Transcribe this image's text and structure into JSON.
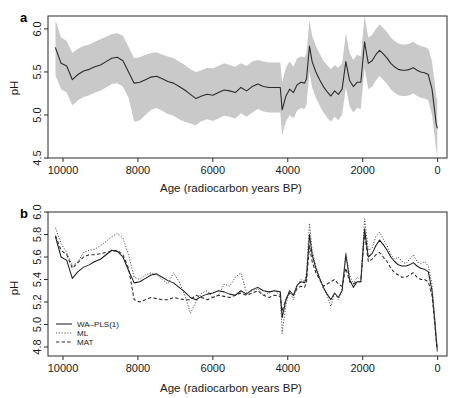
{
  "figure": {
    "panel_a_letter": "a",
    "panel_b_letter": "b",
    "xlabel": "Age (radiocarbon years BP)",
    "ylabel": "pH"
  },
  "chart_data": [
    {
      "type": "line",
      "panel": "a",
      "title": "",
      "xlabel": "Age (radiocarbon years BP)",
      "ylabel": "pH",
      "xlim": [
        10400,
        -250
      ],
      "ylim": [
        4.5,
        6.15
      ],
      "xticks": [
        10000,
        8000,
        6000,
        4000,
        2000,
        0
      ],
      "xticklabels": [
        "10000",
        "8000",
        "6000",
        "4000",
        "2000",
        "0"
      ],
      "yticks": [
        4.5,
        5.0,
        5.5,
        6.0
      ],
      "yticklabels": [
        "4.5",
        "5.0",
        "5.5",
        "6.0"
      ],
      "grid": false,
      "legend": "none",
      "x": [
        10200,
        10050,
        9900,
        9750,
        9600,
        9450,
        9300,
        9150,
        9000,
        8850,
        8700,
        8550,
        8400,
        8250,
        8100,
        7950,
        7800,
        7650,
        7500,
        7350,
        7200,
        7050,
        6900,
        6750,
        6600,
        6450,
        6300,
        6150,
        6000,
        5850,
        5700,
        5550,
        5400,
        5250,
        5100,
        4950,
        4800,
        4650,
        4500,
        4350,
        4200,
        4150,
        4050,
        3950,
        3850,
        3750,
        3650,
        3550,
        3500,
        3420,
        3350,
        3250,
        3150,
        3050,
        2950,
        2850,
        2750,
        2650,
        2550,
        2450,
        2350,
        2250,
        2150,
        2050,
        1950,
        1900,
        1850,
        1750,
        1650,
        1550,
        1450,
        1350,
        1250,
        1150,
        1050,
        950,
        850,
        750,
        650,
        550,
        450,
        350,
        250,
        150,
        80,
        40,
        10
      ],
      "series": [
        {
          "name": "reconstructed-pH",
          "style": "solid",
          "values": [
            5.78,
            5.6,
            5.57,
            5.41,
            5.47,
            5.51,
            5.53,
            5.56,
            5.58,
            5.62,
            5.66,
            5.67,
            5.63,
            5.5,
            5.37,
            5.38,
            5.41,
            5.44,
            5.45,
            5.42,
            5.39,
            5.37,
            5.33,
            5.29,
            5.24,
            5.19,
            5.22,
            5.24,
            5.23,
            5.26,
            5.29,
            5.28,
            5.26,
            5.32,
            5.28,
            5.33,
            5.36,
            5.33,
            5.32,
            5.32,
            5.32,
            5.06,
            5.22,
            5.3,
            5.26,
            5.35,
            5.38,
            5.37,
            5.42,
            5.8,
            5.62,
            5.5,
            5.41,
            5.33,
            5.27,
            5.22,
            5.28,
            5.24,
            5.3,
            5.62,
            5.4,
            5.33,
            5.38,
            5.38,
            5.85,
            5.72,
            5.6,
            5.63,
            5.7,
            5.75,
            5.71,
            5.66,
            5.6,
            5.56,
            5.53,
            5.52,
            5.52,
            5.53,
            5.55,
            5.52,
            5.5,
            5.49,
            5.47,
            5.3,
            5.05,
            4.9,
            4.85
          ]
        }
      ],
      "uncertainty_band": {
        "name": "sample-specific-errors",
        "color": "#c9c9c9",
        "upper": [
          6.1,
          5.9,
          5.86,
          5.72,
          5.77,
          5.8,
          5.82,
          5.85,
          5.88,
          5.91,
          5.94,
          5.95,
          5.92,
          5.79,
          5.66,
          5.67,
          5.7,
          5.72,
          5.73,
          5.7,
          5.68,
          5.66,
          5.62,
          5.58,
          5.53,
          5.5,
          5.52,
          5.55,
          5.54,
          5.57,
          5.6,
          5.58,
          5.56,
          5.6,
          5.57,
          5.62,
          5.64,
          5.62,
          5.61,
          5.61,
          5.61,
          5.38,
          5.55,
          5.62,
          5.56,
          5.66,
          5.68,
          5.67,
          5.72,
          6.1,
          5.92,
          5.8,
          5.71,
          5.63,
          5.58,
          5.53,
          5.58,
          5.55,
          5.6,
          5.95,
          5.72,
          5.64,
          5.7,
          5.68,
          6.16,
          6.02,
          5.9,
          5.93,
          6.0,
          6.05,
          6.01,
          5.96,
          5.9,
          5.86,
          5.83,
          5.82,
          5.82,
          5.83,
          5.85,
          5.82,
          5.8,
          5.79,
          5.77,
          5.62,
          5.38,
          5.22,
          5.17
        ],
        "lower": [
          5.46,
          5.3,
          5.26,
          5.11,
          5.17,
          5.21,
          5.23,
          5.26,
          5.28,
          5.32,
          5.36,
          5.37,
          5.33,
          5.2,
          4.92,
          4.94,
          5.0,
          5.06,
          5.08,
          5.05,
          5.01,
          4.99,
          4.95,
          4.92,
          4.9,
          4.88,
          4.93,
          4.95,
          4.93,
          4.96,
          4.99,
          4.98,
          4.96,
          5.02,
          4.98,
          5.03,
          5.07,
          5.04,
          5.03,
          5.03,
          5.03,
          4.77,
          4.92,
          5.0,
          4.96,
          5.05,
          5.08,
          5.07,
          5.12,
          5.5,
          5.32,
          5.2,
          5.11,
          5.03,
          4.97,
          4.92,
          4.98,
          4.94,
          5.0,
          5.32,
          5.1,
          5.03,
          5.08,
          5.07,
          5.55,
          5.42,
          5.3,
          5.33,
          5.4,
          5.45,
          5.41,
          5.36,
          5.3,
          5.26,
          5.23,
          5.22,
          5.22,
          5.23,
          5.25,
          5.22,
          5.2,
          5.19,
          5.17,
          5.0,
          4.75,
          4.6,
          4.53
        ]
      }
    },
    {
      "type": "line",
      "panel": "b",
      "title": "",
      "xlabel": "Age (radiocarbon years BP)",
      "ylabel": "pH",
      "xlim": [
        10400,
        -250
      ],
      "ylim": [
        4.72,
        6.0
      ],
      "xticks": [
        10000,
        8000,
        6000,
        4000,
        2000,
        0
      ],
      "xticklabels": [
        "10000",
        "8000",
        "6000",
        "4000",
        "2000",
        "0"
      ],
      "yticks": [
        4.8,
        5.0,
        5.2,
        5.4,
        5.6,
        5.8,
        6.0
      ],
      "yticklabels": [
        "4.8",
        "5.0",
        "5.2",
        "5.4",
        "5.6",
        "5.8",
        "6.0"
      ],
      "grid": false,
      "legend": "bottom-left",
      "x": [
        10200,
        10050,
        9900,
        9750,
        9600,
        9450,
        9300,
        9150,
        9000,
        8850,
        8700,
        8550,
        8400,
        8250,
        8100,
        7950,
        7800,
        7650,
        7500,
        7350,
        7200,
        7050,
        6900,
        6750,
        6600,
        6450,
        6300,
        6150,
        6000,
        5850,
        5700,
        5550,
        5400,
        5250,
        5100,
        4950,
        4800,
        4650,
        4500,
        4350,
        4200,
        4150,
        4050,
        3950,
        3850,
        3750,
        3650,
        3550,
        3500,
        3420,
        3350,
        3250,
        3150,
        3050,
        2950,
        2850,
        2750,
        2650,
        2550,
        2450,
        2350,
        2250,
        2150,
        2050,
        1950,
        1900,
        1850,
        1750,
        1650,
        1550,
        1450,
        1350,
        1250,
        1150,
        1050,
        950,
        850,
        750,
        650,
        550,
        450,
        350,
        250,
        150,
        80,
        40,
        10
      ],
      "series": [
        {
          "name": "WA-PLS(1)",
          "label": "WA–PLS(1)",
          "style": "solid",
          "values": [
            5.78,
            5.6,
            5.57,
            5.41,
            5.47,
            5.51,
            5.53,
            5.56,
            5.58,
            5.62,
            5.66,
            5.65,
            5.6,
            5.48,
            5.37,
            5.38,
            5.41,
            5.44,
            5.45,
            5.42,
            5.39,
            5.37,
            5.33,
            5.29,
            5.24,
            5.22,
            5.25,
            5.27,
            5.28,
            5.3,
            5.29,
            5.27,
            5.26,
            5.3,
            5.27,
            5.31,
            5.33,
            5.3,
            5.29,
            5.3,
            5.29,
            5.06,
            5.22,
            5.3,
            5.26,
            5.35,
            5.38,
            5.37,
            5.42,
            5.8,
            5.62,
            5.5,
            5.41,
            5.33,
            5.27,
            5.22,
            5.28,
            5.24,
            5.3,
            5.62,
            5.4,
            5.33,
            5.38,
            5.38,
            5.85,
            5.72,
            5.6,
            5.63,
            5.7,
            5.75,
            5.71,
            5.66,
            5.6,
            5.56,
            5.53,
            5.52,
            5.52,
            5.53,
            5.55,
            5.52,
            5.5,
            5.49,
            5.47,
            5.3,
            5.05,
            4.88,
            4.78
          ]
        },
        {
          "name": "ML",
          "label": "ML",
          "style": "dotted",
          "values": [
            5.86,
            5.72,
            5.64,
            5.52,
            5.56,
            5.64,
            5.66,
            5.67,
            5.7,
            5.74,
            5.78,
            5.81,
            5.77,
            5.62,
            5.42,
            5.4,
            5.44,
            5.46,
            5.44,
            5.4,
            5.36,
            5.46,
            5.38,
            5.26,
            5.1,
            5.2,
            5.28,
            5.3,
            5.24,
            5.26,
            5.36,
            5.34,
            5.42,
            5.46,
            5.28,
            5.3,
            5.32,
            5.26,
            5.28,
            5.3,
            5.26,
            4.92,
            5.18,
            5.3,
            5.22,
            5.34,
            5.4,
            5.38,
            5.46,
            5.9,
            5.66,
            5.52,
            5.42,
            5.32,
            5.26,
            5.16,
            5.28,
            5.22,
            5.32,
            5.64,
            5.44,
            5.36,
            5.42,
            5.4,
            5.94,
            5.8,
            5.66,
            5.68,
            5.78,
            5.82,
            5.76,
            5.7,
            5.62,
            5.58,
            5.6,
            5.56,
            5.54,
            5.58,
            5.62,
            5.56,
            5.54,
            5.56,
            5.52,
            5.36,
            5.06,
            4.9,
            4.8
          ]
        },
        {
          "name": "MAT",
          "label": "MAT",
          "style": "dashed",
          "values": [
            5.79,
            5.66,
            5.62,
            5.5,
            5.55,
            5.6,
            5.62,
            5.62,
            5.63,
            5.64,
            5.65,
            5.66,
            5.62,
            5.5,
            5.22,
            5.2,
            5.22,
            5.24,
            5.23,
            5.22,
            5.22,
            5.24,
            5.23,
            5.22,
            5.22,
            5.26,
            5.24,
            5.22,
            5.24,
            5.26,
            5.25,
            5.24,
            5.26,
            5.28,
            5.26,
            5.28,
            5.3,
            5.26,
            5.24,
            5.26,
            5.25,
            5.12,
            5.22,
            5.28,
            5.26,
            5.32,
            5.34,
            5.33,
            5.38,
            5.7,
            5.56,
            5.46,
            5.4,
            5.34,
            5.36,
            5.38,
            5.4,
            5.36,
            5.34,
            5.5,
            5.38,
            5.36,
            5.38,
            5.38,
            5.82,
            5.68,
            5.56,
            5.58,
            5.62,
            5.64,
            5.6,
            5.56,
            5.5,
            5.46,
            5.44,
            5.42,
            5.42,
            5.44,
            5.46,
            5.42,
            5.4,
            5.4,
            5.38,
            5.26,
            5.02,
            4.86,
            4.76
          ]
        }
      ]
    }
  ]
}
